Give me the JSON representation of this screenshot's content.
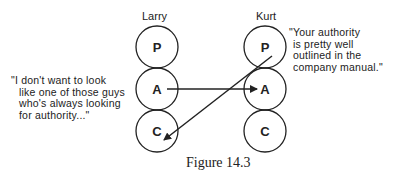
{
  "figure": {
    "caption": "Figure 14.3",
    "left_person": {
      "name": "Larry",
      "quote_lines": [
        "\"I don't want to look",
        "like one of those guys",
        "who's always looking",
        "for authority...\""
      ],
      "states": [
        "P",
        "A",
        "C"
      ]
    },
    "right_person": {
      "name": "Kurt",
      "quote_lines": [
        "\"Your authority",
        "is pretty well",
        "outlined in the",
        "company manual.\""
      ],
      "states": [
        "P",
        "A",
        "C"
      ]
    },
    "transactions": [
      {
        "from": "Larry.A",
        "to": "Kurt.A"
      },
      {
        "from": "Kurt.P",
        "to": "Larry.C"
      }
    ],
    "colors": {
      "line": "#222222",
      "background": "#ffffff"
    }
  }
}
